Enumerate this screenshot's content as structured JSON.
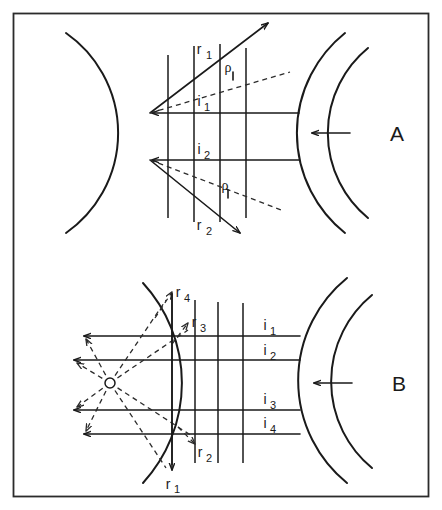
{
  "figure": {
    "border_color": "#2b2b2b",
    "ink_color": "#1a1a1a",
    "background": "#ffffff"
  },
  "panels": [
    {
      "id": "A",
      "label": "A",
      "propagation_arrow": "arrow-left",
      "incident_rays": [
        {
          "name": "i1",
          "base": "i",
          "sub": "1"
        },
        {
          "name": "i2",
          "base": "i",
          "sub": "2"
        }
      ],
      "reflected_rays": [
        {
          "name": "r1",
          "base": "r",
          "sub": "1"
        },
        {
          "name": "r2",
          "base": "r",
          "sub": "2"
        }
      ],
      "angle_labels": [
        {
          "name": "rho-upper",
          "symbol": "ρ"
        },
        {
          "name": "rho-lower",
          "symbol": "ρ"
        }
      ],
      "wavefront_count": 4,
      "arc_count_right": 2
    },
    {
      "id": "B",
      "label": "B",
      "propagation_arrow": "arrow-left",
      "incident_rays": [
        {
          "name": "i1",
          "base": "i",
          "sub": "1"
        },
        {
          "name": "i2",
          "base": "i",
          "sub": "2"
        },
        {
          "name": "i3",
          "base": "i",
          "sub": "3"
        },
        {
          "name": "i4",
          "base": "i",
          "sub": "4"
        }
      ],
      "reflected_rays": [
        {
          "name": "r1",
          "base": "r",
          "sub": "1"
        },
        {
          "name": "r2",
          "base": "r",
          "sub": "2"
        },
        {
          "name": "r3",
          "base": "r",
          "sub": "3"
        },
        {
          "name": "r4",
          "base": "r",
          "sub": "4"
        }
      ],
      "wavefront_count": 4,
      "arc_count_right": 2,
      "focus_point": "open-circle"
    }
  ]
}
